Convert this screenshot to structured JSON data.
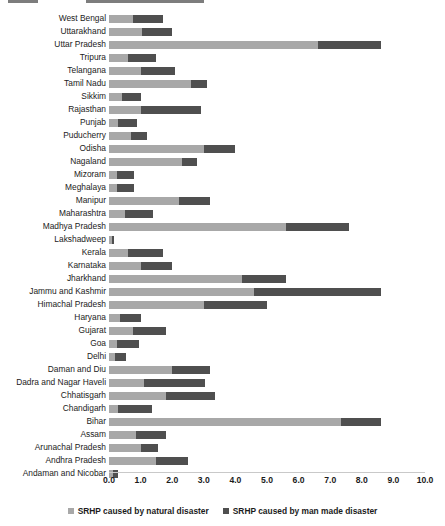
{
  "chart_data": {
    "type": "bar",
    "orientation": "horizontal",
    "stacked": true,
    "title": "",
    "xlabel": "",
    "ylabel": "",
    "xlim": [
      0.0,
      10.0
    ],
    "grid": false,
    "legend_position": "bottom",
    "tick_labels": [
      "0.0",
      "1.0",
      "2.0",
      "3.0",
      "4.0",
      "5.0",
      "6.0",
      "7.0",
      "8.0",
      "9.0",
      "10.0"
    ],
    "tick_values": [
      0,
      1,
      2,
      3,
      4,
      5,
      6,
      7,
      8,
      9,
      10
    ],
    "series": [
      {
        "name": "SRHP caused by natural disaster",
        "color": "#a8a8a8",
        "values": [
          0.75,
          1.05,
          6.6,
          0.6,
          1.0,
          2.6,
          0.4,
          1.0,
          0.3,
          0.7,
          3.0,
          2.3,
          0.25,
          0.25,
          2.2,
          0.5,
          5.6,
          0.1,
          0.6,
          1.0,
          4.2,
          4.6,
          3.0,
          0.35,
          0.75,
          0.25,
          0.2,
          2.0,
          1.1,
          1.8,
          0.3,
          7.35,
          0.85,
          1.0,
          1.5,
          0.12
        ]
      },
      {
        "name": "SRHP caused by man made disaster",
        "color": "#4f4f4f",
        "values": [
          0.95,
          0.95,
          2.0,
          0.9,
          1.1,
          0.5,
          0.6,
          1.9,
          0.6,
          0.5,
          1.0,
          0.5,
          0.55,
          0.55,
          1.0,
          0.9,
          2.0,
          0.05,
          1.1,
          1.0,
          1.4,
          4.0,
          2.0,
          0.65,
          1.05,
          0.7,
          0.35,
          1.2,
          1.95,
          1.55,
          1.05,
          1.25,
          0.95,
          0.55,
          1.0,
          0.18
        ]
      }
    ],
    "categories": [
      "West Bengal",
      "Uttarakhand",
      "Uttar Pradesh",
      "Tripura",
      "Telangana",
      "Tamil Nadu",
      "Sikkim",
      "Rajasthan",
      "Punjab",
      "Puducherry",
      "Odisha",
      "Nagaland",
      "Mizoram",
      "Meghalaya",
      "Manipur",
      "Maharashtra",
      "Madhya Pradesh",
      "Lakshadweep",
      "Kerala",
      "Karnataka",
      "Jharkhand",
      "Jammu and Kashmir",
      "Himachal Pradesh",
      "Haryana",
      "Gujarat",
      "Goa",
      "Delhi",
      "Daman and Diu",
      "Dadra and Nagar Haveli",
      "Chhatisgarh",
      "Chandigarh",
      "Bihar",
      "Assam",
      "Arunachal Pradesh",
      "Andhra Pradesh",
      "Andaman and Nicobar"
    ]
  },
  "legend": {
    "items": [
      {
        "label": "SRHP caused by natural disaster",
        "color": "#a8a8a8"
      },
      {
        "label": "SRHP caused by man made disaster",
        "color": "#4f4f4f"
      }
    ]
  }
}
